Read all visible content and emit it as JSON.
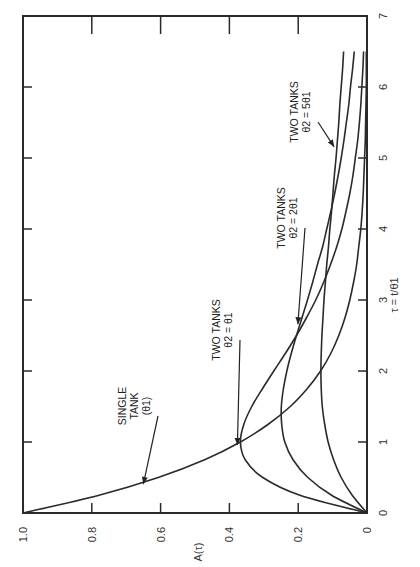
{
  "chart_data": {
    "type": "line",
    "orientation": "rotated-90-ccw",
    "title": "",
    "xlabel": "τ = t/θ1",
    "ylabel": "A(τ)",
    "xlim": [
      0,
      7
    ],
    "ylim": [
      0,
      1.0
    ],
    "x_ticks": [
      "0",
      "1",
      "2",
      "3",
      "4",
      "5",
      "6",
      "7"
    ],
    "y_ticks": [
      "0",
      "0.2",
      "0.4",
      "0.6",
      "0.8",
      "1.0"
    ],
    "grid": false,
    "legend": "inline annotations",
    "x": [
      0,
      0.25,
      0.5,
      0.75,
      1,
      1.25,
      1.5,
      1.75,
      2,
      2.25,
      2.5,
      2.75,
      3,
      3.25,
      3.5,
      3.75,
      4,
      4.25,
      4.5,
      4.75,
      5,
      5.25,
      5.5,
      5.75,
      6,
      6.25,
      6.5
    ],
    "series": [
      {
        "name": "SINGLE TANK (θ1)",
        "values": [
          1,
          0.779,
          0.607,
          0.472,
          0.368,
          0.287,
          0.223,
          0.174,
          0.135,
          0.105,
          0.082,
          0.064,
          0.05,
          0.039,
          0.03,
          0.024,
          0.018,
          0.014,
          0.011,
          0.009,
          0.007,
          0.005,
          0.004,
          0.003,
          0.002,
          0.002,
          0.002
        ]
      },
      {
        "name": "TWO TANKS θ2 = θ1",
        "values": [
          0,
          0.195,
          0.303,
          0.354,
          0.368,
          0.358,
          0.335,
          0.304,
          0.271,
          0.237,
          0.205,
          0.176,
          0.149,
          0.126,
          0.106,
          0.088,
          0.073,
          0.061,
          0.05,
          0.041,
          0.034,
          0.027,
          0.022,
          0.018,
          0.015,
          0.012,
          0.01
        ]
      },
      {
        "name": "TWO TANKS θ2 = 2θ1",
        "values": [
          0,
          0.103,
          0.172,
          0.215,
          0.239,
          0.248,
          0.249,
          0.243,
          0.233,
          0.22,
          0.205,
          0.189,
          0.173,
          0.158,
          0.144,
          0.129,
          0.117,
          0.105,
          0.094,
          0.084,
          0.075,
          0.067,
          0.06,
          0.053,
          0.048,
          0.042,
          0.037
        ]
      },
      {
        "name": "TWO TANKS θ2 = 5θ1",
        "values": [
          0,
          0.043,
          0.075,
          0.097,
          0.113,
          0.123,
          0.13,
          0.133,
          0.134,
          0.133,
          0.131,
          0.128,
          0.125,
          0.121,
          0.117,
          0.112,
          0.108,
          0.103,
          0.099,
          0.095,
          0.09,
          0.086,
          0.082,
          0.079,
          0.075,
          0.071,
          0.068
        ]
      }
    ],
    "annotations": [
      {
        "lines": [
          "SINGLE",
          "TANK",
          "(θ1)"
        ],
        "target_series": 0,
        "at_x": 0.45
      },
      {
        "lines": [
          "TWO TANKS",
          "θ2 = θ1"
        ],
        "target_series": 1,
        "at_x": 1.0
      },
      {
        "lines": [
          "TWO TANKS",
          "θ2 = 2θ1"
        ],
        "target_series": 2,
        "at_x": 2.7
      },
      {
        "lines": [
          "TWO TANKS",
          "θ2 = 5θ1"
        ],
        "target_series": 3,
        "at_x": 5.2
      }
    ]
  }
}
